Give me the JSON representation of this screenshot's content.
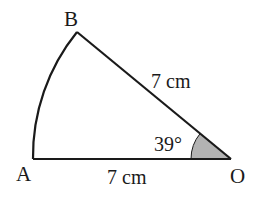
{
  "diagram": {
    "type": "sector",
    "vertices": {
      "A": "A",
      "B": "B",
      "O": "O"
    },
    "side_OB": "7 cm",
    "side_OA": "7 cm",
    "angle_AOB": "39°",
    "colors": {
      "stroke": "#1a1a1a",
      "angle_fill": "#b3b3b3",
      "background": "#ffffff"
    }
  }
}
